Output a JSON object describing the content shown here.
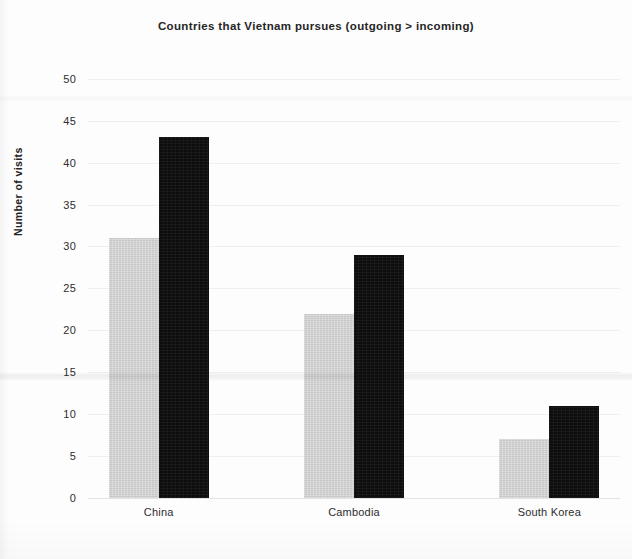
{
  "chart_data": {
    "type": "bar",
    "title": "Countries that Vietnam pursues (outgoing > incoming)",
    "xlabel": "",
    "ylabel": "Number of visits",
    "categories": [
      "China",
      "Cambodia",
      "South Korea"
    ],
    "series": [
      {
        "name": "incoming",
        "color": "#cfcfcf",
        "values": [
          31,
          22,
          7
        ]
      },
      {
        "name": "outgoing",
        "color": "#0d0d0d",
        "values": [
          43,
          29,
          11
        ]
      }
    ],
    "ylim": [
      0,
      50
    ],
    "ytick_step": 5,
    "yticks": [
      "0",
      "5",
      "10",
      "15",
      "20",
      "25",
      "30",
      "35",
      "40",
      "45",
      "50"
    ],
    "grid": true,
    "legend": "none",
    "legend_position": "none"
  },
  "axes": {
    "y_title": "Number of visits",
    "y_tick_labels": [
      "50",
      "45",
      "40",
      "35",
      "30",
      "25",
      "20",
      "15",
      "10",
      "5",
      "0"
    ],
    "x_tick_labels": [
      "China",
      "Cambodia",
      "South Korea"
    ]
  },
  "header": {
    "title": "Countries that Vietnam pursues (outgoing > incoming)"
  }
}
